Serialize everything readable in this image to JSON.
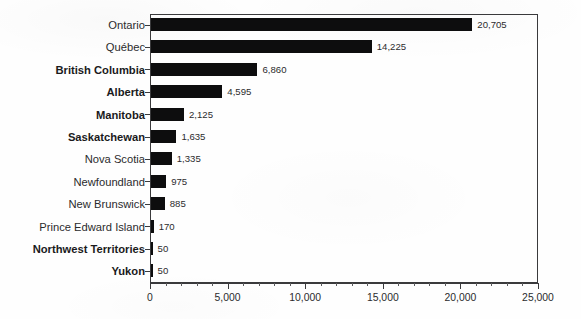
{
  "chart_data": {
    "type": "bar",
    "orientation": "horizontal",
    "title": "",
    "subtitle": "",
    "xlabel": "",
    "ylabel": "",
    "xlim": [
      0,
      25000
    ],
    "grid": false,
    "legend": null,
    "x_major_tick_step": 5000,
    "x_minor_tick_step": 1000,
    "xticklabels": [
      "0",
      "5,000",
      "10,000",
      "15,000",
      "20,000",
      "25,000"
    ],
    "xticks": [
      0,
      5000,
      10000,
      15000,
      20000,
      25000
    ],
    "categories": [
      "Ontario",
      "Québec",
      "British Columbia",
      "Alberta",
      "Manitoba",
      "Saskatchewan",
      "Nova Scotia",
      "Newfoundland",
      "New Brunswick",
      "Prince Edward Island",
      "Northwest Territories",
      "Yukon"
    ],
    "values": [
      20705,
      14225,
      6860,
      4595,
      2125,
      1635,
      1335,
      975,
      885,
      170,
      50,
      50
    ],
    "value_labels": [
      "20,705",
      "14,225",
      "6,860",
      "4,595",
      "2,125",
      "1,635",
      "1,335",
      "975",
      "885",
      "170",
      "50",
      "50"
    ],
    "label_emphasis": [
      false,
      false,
      true,
      true,
      true,
      true,
      false,
      false,
      false,
      false,
      true,
      true
    ],
    "bar_color": "#0d0d0e",
    "axis_color": "#3a3a3c",
    "text_color": "#2b2b2d",
    "background_color": "#fefefe"
  }
}
